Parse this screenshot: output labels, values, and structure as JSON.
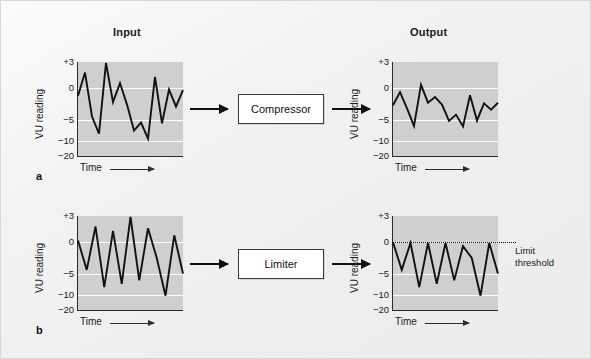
{
  "figure": {
    "column_headings": [
      {
        "label": "Input",
        "x": 113,
        "y": 32
      },
      {
        "label": "Output",
        "x": 410,
        "y": 32
      }
    ],
    "panel_letters": [
      {
        "label": "a",
        "x": 39,
        "y": 175
      },
      {
        "label": "b",
        "x": 39,
        "y": 327
      }
    ],
    "processors": [
      {
        "label": "Compressor",
        "x": 238,
        "y": 94,
        "w": 86,
        "h": 30
      },
      {
        "label": "Limiter",
        "x": 238,
        "y": 249,
        "w": 86,
        "h": 30
      }
    ],
    "arrows": [
      {
        "x": 190,
        "y": 109,
        "w": 44
      },
      {
        "x": 328,
        "y": 109,
        "w": 44
      },
      {
        "x": 190,
        "y": 264,
        "w": 44
      },
      {
        "x": 328,
        "y": 264,
        "w": 44
      }
    ],
    "annotation": {
      "label": "Limit\nthreshold",
      "line1": "Limit",
      "line2": "threshold",
      "x": 515,
      "y": 246
    }
  },
  "axis": {
    "ylabel": "VU reading",
    "xlabel": "Time",
    "yticks": [
      {
        "label": "+3",
        "value": 3,
        "frac": 0.0
      },
      {
        "label": "0",
        "value": 0,
        "frac": 0.28
      },
      {
        "label": "−5",
        "value": -5,
        "frac": 0.613
      },
      {
        "label": "−10",
        "value": -10,
        "frac": 0.838
      },
      {
        "label": "−20",
        "value": -20,
        "frac": 1.0
      }
    ],
    "gridlines": [
      0.28,
      0.613,
      0.838
    ]
  },
  "chart_data": {
    "type": "line",
    "xlabel": "Time",
    "ylabel": "VU reading",
    "ylim": [
      -20,
      3
    ],
    "ytick_labels": [
      "+3",
      "0",
      "−5",
      "−10",
      "−20"
    ],
    "ytick_values": [
      3,
      0,
      -5,
      -10,
      -20
    ],
    "grid": true,
    "y_scale": "VU meter (non-linear, compressed below −5)",
    "panels": [
      {
        "id": "a-input",
        "row_letter": "a",
        "column": "Input",
        "process": "Compressor",
        "series_name": "Input signal (uncompressed)",
        "values": [
          -1.2,
          1.8,
          -4.5,
          -8.3,
          2.9,
          -2.2,
          0.6,
          -2.6,
          -7.6,
          -5.7,
          -9.5,
          1.3,
          -5.9,
          -0.2,
          -2.9,
          -0.3
        ]
      },
      {
        "id": "a-output",
        "row_letter": "a",
        "column": "Output",
        "process": "Compressor",
        "series_name": "Output signal (compressed, reduced dynamic range)",
        "values": [
          -2.7,
          -0.6,
          -3.2,
          -6.5,
          0.4,
          -2.3,
          -1.4,
          -2.6,
          -5.3,
          -4.2,
          -6.6,
          -1.1,
          -5.2,
          -2.4,
          -3.4,
          -2.3
        ]
      },
      {
        "id": "b-input",
        "row_letter": "b",
        "column": "Input",
        "process": "Limiter",
        "series_name": "Input signal (unlimited peaks)",
        "values": [
          0.2,
          -4.4,
          1.8,
          -8.2,
          1.3,
          -7.4,
          2.9,
          -6.6,
          1.6,
          -2.5,
          -10.6,
          0.8,
          -5.0
        ],
        "has_threshold": false
      },
      {
        "id": "b-output",
        "row_letter": "b",
        "column": "Output",
        "process": "Limiter",
        "series_name": "Output signal (peaks clipped at limit threshold)",
        "values": [
          0.0,
          -4.4,
          -0.1,
          -8.2,
          -0.1,
          -7.4,
          -0.1,
          -6.6,
          -0.6,
          -2.5,
          -10.6,
          -0.1,
          -5.0
        ],
        "has_threshold": true,
        "threshold_value": 0,
        "threshold_label": "Limit threshold"
      }
    ]
  },
  "layout": {
    "panels": [
      {
        "id": "a-input",
        "plot_x": 78,
        "plot_y": 62,
        "plot_w": 105,
        "plot_h": 94
      },
      {
        "id": "a-output",
        "plot_x": 393,
        "plot_y": 62,
        "plot_w": 105,
        "plot_h": 94
      },
      {
        "id": "b-input",
        "plot_x": 78,
        "plot_y": 216,
        "plot_w": 105,
        "plot_h": 94
      },
      {
        "id": "b-output",
        "plot_x": 393,
        "plot_y": 216,
        "plot_w": 105,
        "plot_h": 94
      }
    ]
  },
  "colors": {
    "page_background": "#f2f2f2",
    "plot_fill": "#cfcfcf",
    "gridline": "#ffffff",
    "trace": "#111111",
    "axis": "#2b2b2b",
    "box_fill": "#ffffff",
    "box_border": "#3a3a3a",
    "text": "#1a1a1a"
  }
}
